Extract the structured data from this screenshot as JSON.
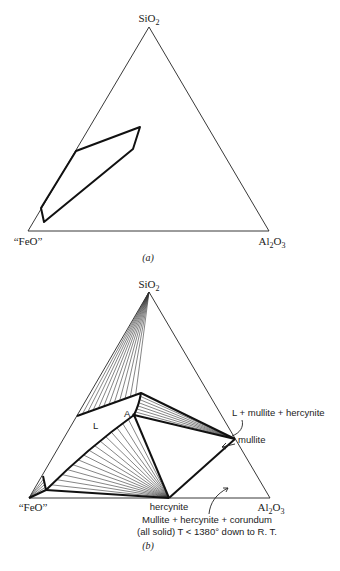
{
  "figure_a": {
    "label": "(a)",
    "vertices": {
      "top": {
        "label": "SiO",
        "sub": "2",
        "x": 149,
        "y": 27
      },
      "left": {
        "label": "“FeO”",
        "x": 28,
        "y": 231
      },
      "right": {
        "label": "Al",
        "sub1": "2",
        "mid": "O",
        "sub2": "3",
        "x": 269,
        "y": 231
      }
    },
    "liquid_region": [
      [
        76,
        151
      ],
      [
        140,
        127
      ],
      [
        133,
        149
      ],
      [
        44,
        222
      ],
      [
        41,
        208
      ]
    ]
  },
  "figure_b": {
    "label": "(b)",
    "vertices": {
      "top": {
        "label": "SiO",
        "sub": "2",
        "x": 149,
        "y": 292
      },
      "left": {
        "label": "“FeO”",
        "x": 29,
        "y": 498
      },
      "right": {
        "label": "Al",
        "sub1": "2",
        "mid": "O",
        "sub2": "3",
        "x": 270,
        "y": 498
      }
    },
    "points": {
      "upper_liquid": [
        141,
        393
      ],
      "A": [
        134,
        415
      ],
      "left_edge": [
        77,
        416
      ],
      "mullite": [
        235,
        439
      ],
      "hercynite": [
        169,
        498
      ],
      "lower_left": [
        46,
        490
      ],
      "feo_edge": [
        43,
        476
      ]
    },
    "labels": {
      "L": "L",
      "A": "A",
      "mullite": "mullite",
      "hercynite": "hercynite",
      "three_phase": "L + mullite + hercynite",
      "solid_line1": "Mullite + hercynite + corundum",
      "solid_line2": "(all solid) T < 1380° down to R. T."
    }
  }
}
